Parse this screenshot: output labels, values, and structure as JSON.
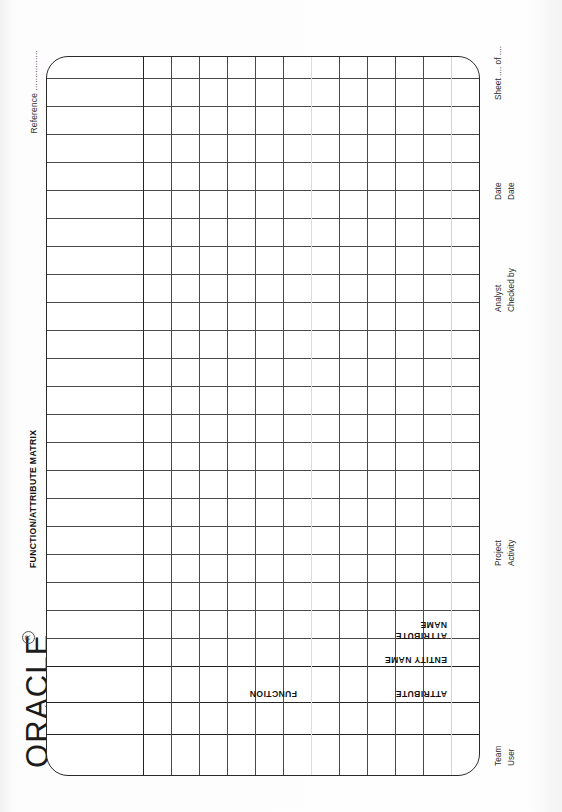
{
  "document": {
    "kind": "scanned-paper-form",
    "orientation": "landscape-page-shown-rotated",
    "form_title": "FUNCTION/ATTRIBUTE MATRIX"
  },
  "logo": {
    "wordmark": "ORACLE",
    "registered_mark": "R",
    "tagline": "THE RELATIONAL DATABASE\nMANAGEMENT SYSTEM",
    "starburst_icon": "oracle-starburst-icon"
  },
  "reference": {
    "label": "Reference ................"
  },
  "grid": {
    "header_labels": {
      "attribute": "ATTRIBUTE",
      "entity_name": "ENTITY NAME",
      "attribute_name": "ATTRIBUTE\nNAME",
      "function": "FUNCTION"
    },
    "columns": {
      "label_band_count": 2,
      "body_column_count": 22,
      "body_rows": 14
    },
    "cells": []
  },
  "footer": {
    "team": "Team",
    "user": "User",
    "project": "Project",
    "activity": "Activity",
    "analyst": "Analyst",
    "checked_by": "Checked by",
    "date_analyst": "Date",
    "date_checked": "Date",
    "sheet": "Sheet .... of ...."
  },
  "colors": {
    "paper": "#fdfdfd",
    "ink": "#1a1a1a",
    "rule": "#4a4a4a",
    "rule_heavy": "#242424",
    "scan_tint_cyan": "#b9dfe0",
    "scan_tint_warm": "#e8dcc8"
  }
}
